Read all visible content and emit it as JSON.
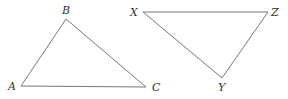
{
  "diagram": {
    "triangles": [
      {
        "name": "ABC",
        "vertices": [
          {
            "label": "A",
            "x": 21,
            "y": 86,
            "lx": 8,
            "ly": 90
          },
          {
            "label": "B",
            "x": 66,
            "y": 19,
            "lx": 62,
            "ly": 14
          },
          {
            "label": "C",
            "x": 146,
            "y": 87,
            "lx": 152,
            "ly": 91
          }
        ]
      },
      {
        "name": "XYZ",
        "vertices": [
          {
            "label": "X",
            "x": 143,
            "y": 12,
            "lx": 130,
            "ly": 16
          },
          {
            "label": "Y",
            "x": 222,
            "y": 78,
            "lx": 218,
            "ly": 91
          },
          {
            "label": "Z",
            "x": 268,
            "y": 12,
            "lx": 271,
            "ly": 16
          }
        ]
      }
    ]
  }
}
